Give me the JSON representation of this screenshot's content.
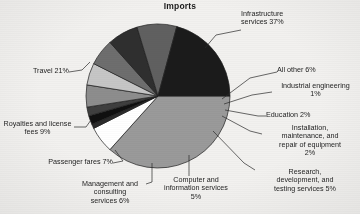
{
  "chart_data": {
    "type": "pie",
    "title": "Imports",
    "xlabel": "",
    "ylabel": "",
    "legend_position": "none",
    "grid": false,
    "units": "percent",
    "categories": [
      "Infrastructure services",
      "All other",
      "Industrial engineering",
      "Education",
      "Installation, maintenance, and repair of equipment",
      "Research, development, and testing services",
      "Computer and information services",
      "Management and consulting services",
      "Passenger fares",
      "Royalties and license fees",
      "Travel"
    ],
    "values": [
      37,
      6,
      1,
      2,
      2,
      5,
      5,
      6,
      7,
      9,
      21
    ],
    "colors": [
      "#9a9a9a",
      "#ffffff",
      "#2b2b2b",
      "#111111",
      "#3c3c3c",
      "#8d8d8d",
      "#c3c3c3",
      "#6d6d6d",
      "#2f2f2f",
      "#5d5d5d",
      "#8f8f8f",
      "#1a1a1a"
    ],
    "slices": [
      {
        "label": "Infrastructure services 37%",
        "value": 37,
        "color": "#9a9a9a"
      },
      {
        "label": "All other 6%",
        "value": 6,
        "color": "#ffffff"
      },
      {
        "label": "Industrial engineering 1%",
        "value": 1,
        "color": "#2b2b2b"
      },
      {
        "label": "Education 2%",
        "value": 2,
        "color": "#101010"
      },
      {
        "label": "Installation, maintenance, and repair of equipment 2%",
        "value": 2,
        "color": "#3f3f3f"
      },
      {
        "label": "Research, development, and testing services 5%",
        "value": 5,
        "color": "#8d8d8d"
      },
      {
        "label": "Computer and information services 5%",
        "value": 5,
        "color": "#c6c6c6"
      },
      {
        "label": "Management and consulting services 6%",
        "value": 6,
        "color": "#6e6e6e"
      },
      {
        "label": "Passenger fares 7%",
        "value": 7,
        "color": "#2f2f2f"
      },
      {
        "label": "Royalties and license fees 9%",
        "value": 9,
        "color": "#606060"
      },
      {
        "label": "Travel 21%",
        "value": 21,
        "color": "#1b1b1b"
      }
    ]
  },
  "title": "Imports",
  "labels": {
    "infrastructure": "Infrastructure\nservices 37%",
    "all_other": "All other 6%",
    "industrial_engineering": "Industrial engineering\n1%",
    "education": "Education 2%",
    "installation": "Installation,\nmaintenance, and\nrepair of equipment\n2%",
    "research": "Research,\ndevelopment, and\ntesting services 5%",
    "computer": "Computer and\ninformation services\n5%",
    "management": "Management and\nconsulting\nservices 6%",
    "passenger_fares": "Passenger fares 7%",
    "royalties": "Royalties and license\nfees 9%",
    "travel": "Travel 21%"
  }
}
